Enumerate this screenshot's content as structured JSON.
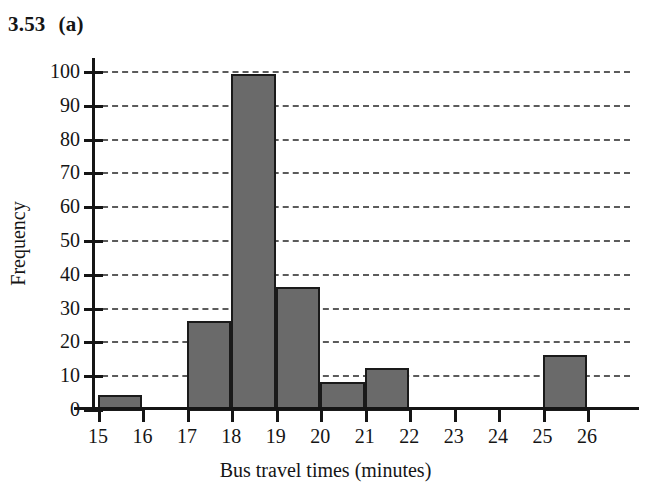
{
  "figure": {
    "label_number": "3.53",
    "label_part": "(a)"
  },
  "chart_data": {
    "type": "bar",
    "xlabel": "Bus travel times (minutes)",
    "ylabel": "Frequency",
    "xlim": [
      15,
      26
    ],
    "ylim": [
      0,
      100
    ],
    "grid": true,
    "legend": null,
    "bin_width": 1,
    "bar_color": "#6a6a6a",
    "bar_edge_color": "#1a1a1a",
    "xticks": [
      15,
      16,
      17,
      18,
      19,
      20,
      21,
      22,
      23,
      24,
      25,
      26
    ],
    "xtick_labels": [
      "15",
      "16",
      "17",
      "18",
      "19",
      "20",
      "21",
      "22",
      "23",
      "24",
      "25",
      "26"
    ],
    "yticks": [
      0,
      10,
      20,
      30,
      40,
      50,
      60,
      70,
      80,
      90,
      100
    ],
    "ytick_labels": [
      "0",
      "10",
      "20",
      "30",
      "40",
      "50",
      "60",
      "70",
      "80",
      "90",
      "100"
    ],
    "categories": [
      "15-16",
      "16-17",
      "17-18",
      "18-19",
      "19-20",
      "20-21",
      "21-22",
      "22-23",
      "23-24",
      "24-25",
      "25-26"
    ],
    "bins": [
      {
        "start": 15,
        "end": 16,
        "value": 4
      },
      {
        "start": 16,
        "end": 17,
        "value": 0
      },
      {
        "start": 17,
        "end": 18,
        "value": 26
      },
      {
        "start": 18,
        "end": 19,
        "value": 99
      },
      {
        "start": 19,
        "end": 20,
        "value": 36
      },
      {
        "start": 20,
        "end": 21,
        "value": 8
      },
      {
        "start": 21,
        "end": 22,
        "value": 12
      },
      {
        "start": 22,
        "end": 23,
        "value": 0
      },
      {
        "start": 23,
        "end": 24,
        "value": 0
      },
      {
        "start": 24,
        "end": 25,
        "value": 0
      },
      {
        "start": 25,
        "end": 26,
        "value": 16
      }
    ],
    "values": [
      4,
      0,
      26,
      99,
      36,
      8,
      12,
      0,
      0,
      0,
      16
    ]
  }
}
